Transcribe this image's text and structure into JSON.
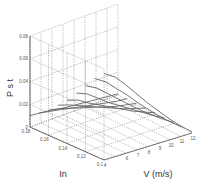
{
  "chart_data": {
    "type": "line3d",
    "title": "",
    "xlabel": "V (m/s)",
    "ylabel": "In",
    "zlabel": "P s t",
    "x_ticks": [
      "4",
      "6",
      "7",
      "8",
      "9",
      "10",
      "11",
      "12"
    ],
    "y_ticks": [
      "0.18",
      "0.16",
      "0.14",
      "0.12",
      "0.1"
    ],
    "z_ticks": [
      "0",
      "0.02",
      "0.04",
      "0.06",
      "0.08"
    ],
    "xlim": [
      4,
      12
    ],
    "ylim": [
      0.1,
      0.18
    ],
    "zlim": [
      0,
      0.08
    ],
    "grid": true,
    "series": [
      {
        "name": "In=0.18",
        "In": 0.18,
        "x": [
          4,
          5,
          6,
          7,
          8,
          9,
          10,
          11,
          12
        ],
        "z": [
          0.01,
          0.009,
          0.008,
          0.006,
          0.005,
          0.004,
          0.003,
          0.002,
          0.001
        ]
      },
      {
        "name": "In=0.17",
        "In": 0.17,
        "x": [
          4,
          5,
          6,
          7,
          8,
          9,
          10,
          11,
          12
        ],
        "z": [
          0.016,
          0.014,
          0.012,
          0.01,
          0.008,
          0.006,
          0.004,
          0.002,
          0.001
        ]
      },
      {
        "name": "In=0.16",
        "In": 0.16,
        "x": [
          4,
          5,
          6,
          7,
          8,
          9,
          10,
          11,
          12
        ],
        "z": [
          0.022,
          0.02,
          0.017,
          0.014,
          0.011,
          0.008,
          0.005,
          0.003,
          0.001
        ]
      },
      {
        "name": "In=0.15",
        "In": 0.15,
        "x": [
          4,
          5,
          6,
          7,
          8,
          9,
          10,
          11,
          12
        ],
        "z": [
          0.03,
          0.027,
          0.023,
          0.019,
          0.015,
          0.011,
          0.007,
          0.004,
          0.001
        ]
      },
      {
        "name": "In=0.14",
        "In": 0.14,
        "x": [
          4,
          5,
          6,
          7,
          8,
          9,
          10,
          11,
          12
        ],
        "z": [
          0.038,
          0.035,
          0.029,
          0.024,
          0.019,
          0.014,
          0.009,
          0.005,
          0.001
        ]
      },
      {
        "name": "In=0.13",
        "In": 0.13,
        "x": [
          4,
          5,
          6,
          7,
          8,
          9,
          10,
          11,
          12
        ],
        "z": [
          0.048,
          0.044,
          0.037,
          0.03,
          0.024,
          0.018,
          0.012,
          0.006,
          0.001
        ]
      },
      {
        "name": "In=0.12",
        "In": 0.12,
        "x": [
          4,
          5,
          6,
          7,
          8,
          9,
          10,
          11,
          12
        ],
        "z": [
          0.058,
          0.053,
          0.045,
          0.037,
          0.029,
          0.021,
          0.014,
          0.007,
          0.001
        ]
      },
      {
        "name": "In=0.11",
        "In": 0.11,
        "x": [
          4,
          5,
          6,
          7,
          8,
          9,
          10,
          11,
          12
        ],
        "z": [
          0.068,
          0.062,
          0.053,
          0.044,
          0.034,
          0.025,
          0.016,
          0.008,
          0.001
        ]
      },
      {
        "name": "In=0.10",
        "In": 0.1,
        "x": [
          4,
          5,
          6,
          7,
          8,
          9,
          10,
          11,
          12
        ],
        "z": [
          0.076,
          0.07,
          0.06,
          0.049,
          0.038,
          0.028,
          0.018,
          0.009,
          0.001
        ]
      }
    ]
  }
}
